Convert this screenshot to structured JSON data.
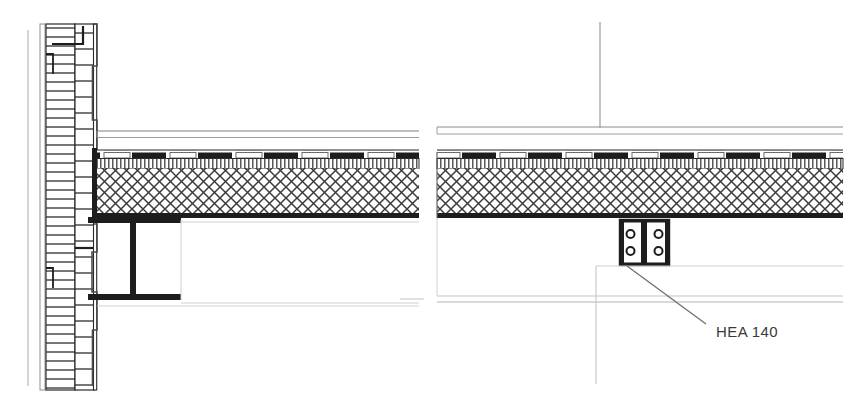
{
  "drawing": {
    "type": "architectural-detail-section",
    "title": "",
    "background_color": "#ffffff",
    "line_color": "#1a1a1a",
    "light_line_color": "#c9c9c9",
    "mid_line_color": "#9a9a9a",
    "hatch_color": "#4a4a4a",
    "width": 849,
    "height": 403,
    "annotations": [
      {
        "id": "hea-140",
        "label": "HEA 140",
        "text_x": 716,
        "text_y": 332,
        "leader_from_x": 706,
        "leader_from_y": 324,
        "leader_to_x": 627,
        "leader_to_y": 266
      }
    ],
    "components": {
      "left_panel": {
        "name": "wall-floor-junction-detail",
        "wall": {
          "name": "exterior-wall-assembly",
          "x": 38,
          "y_top": 22,
          "y_bottom": 392,
          "layers": [
            {
              "name": "outer-leaf",
              "x": 38,
              "width": 6,
              "hatch": "none"
            },
            {
              "name": "masonry-leaf-outer",
              "x": 46,
              "width": 28,
              "hatch": "horizontal"
            },
            {
              "name": "cavity-insulation",
              "x": 74,
              "width": 20,
              "hatch": "horizontal"
            },
            {
              "name": "inner-finish",
              "x": 92,
              "width": 5,
              "hatch": "solid"
            }
          ]
        },
        "beam": {
          "name": "steel-i-beam-elevation",
          "x_left": 88,
          "x_right": 181,
          "top_flange_y": 217,
          "top_flange_h": 6,
          "bottom_flange_y": 294,
          "bottom_flange_h": 6,
          "web_x": 130,
          "web_w": 6
        },
        "slab": {
          "name": "composite-floor-slab",
          "x_left": 92,
          "x_right": 419,
          "y_top": 152,
          "y_bottom": 218,
          "screed_band_y": 152,
          "screed_band_h": 10,
          "core_y": 162,
          "core_h": 50
        },
        "ceiling_lines": {
          "name": "suspended-ceiling-lines",
          "y1": 131,
          "y2": 137,
          "x_left": 97,
          "x_right": 419
        }
      },
      "right_panel": {
        "name": "floor-slab-column-detail",
        "slab": {
          "name": "composite-floor-slab",
          "x_left": 437,
          "x_right": 843,
          "y_top": 152,
          "y_bottom": 218,
          "screed_band_y": 152,
          "screed_band_h": 10,
          "core_y": 162,
          "core_h": 50
        },
        "ceiling_lines": {
          "name": "suspended-ceiling-lines",
          "y1": 127,
          "y2": 134,
          "x_left": 437,
          "x_right": 843
        },
        "column": {
          "name": "hea-140-steel-column-plan",
          "x_left": 619,
          "x_right": 670,
          "y_top": 219,
          "y_bottom": 266,
          "flange_thickness": 5,
          "web_x": 641,
          "web_w": 6,
          "bolt_holes": [
            {
              "cx": 630,
              "cy": 234,
              "r": 4
            },
            {
              "cx": 659,
              "cy": 234,
              "r": 4
            },
            {
              "cx": 630,
              "cy": 251,
              "r": 4
            },
            {
              "cx": 659,
              "cy": 251,
              "r": 4
            }
          ]
        },
        "grid_vertical": {
          "name": "column-grid-line",
          "x": 600,
          "y_top": 22,
          "y_bottom": 128
        },
        "lower_lines": {
          "name": "lower-construction-lines",
          "y1": 296,
          "y2": 302,
          "x_left": 437,
          "x_right": 843
        }
      }
    }
  }
}
